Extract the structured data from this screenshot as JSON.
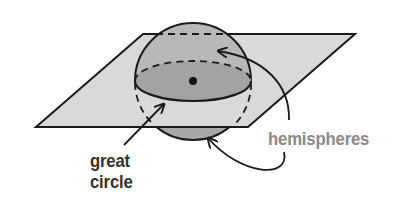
{
  "diagram": {
    "labels": {
      "great_circle_line1": "great",
      "great_circle_line2": "circle",
      "hemispheres": "hemispheres"
    },
    "colors": {
      "plane_fill": "#d9d9d9",
      "sphere_upper_fill": "#b5b5b5",
      "sphere_lower_fill": "#a8a8a8",
      "cross_section_fill": "#a3a3a3",
      "stroke": "#1a1a1a",
      "great_circle_label": "#333333",
      "hemispheres_label": "#8a8a8a"
    },
    "elements": [
      {
        "id": "plane",
        "kind": "parallelogram"
      },
      {
        "id": "sphere",
        "kind": "sphere"
      },
      {
        "id": "great-circle",
        "kind": "ellipse"
      },
      {
        "id": "center-point",
        "kind": "dot"
      },
      {
        "id": "great-circle-arrow",
        "kind": "arrow",
        "points_to": "great-circle"
      },
      {
        "id": "hemisphere-upper-arrow",
        "kind": "curved-arrow",
        "points_to": "upper hemisphere"
      },
      {
        "id": "hemisphere-lower-arrow",
        "kind": "curved-arrow",
        "points_to": "lower hemisphere"
      }
    ]
  }
}
